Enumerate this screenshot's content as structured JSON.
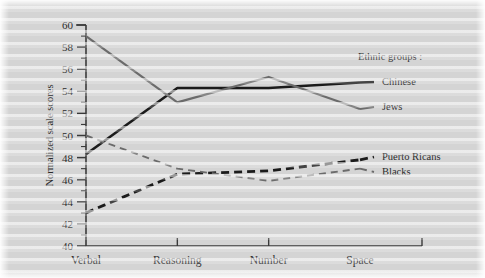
{
  "chart_data": {
    "type": "line",
    "title": "",
    "xlabel": "",
    "ylabel": "Normalized scale scores",
    "categories": [
      "Verbal",
      "Reasoning",
      "Number",
      "Space"
    ],
    "ylim": [
      40,
      60
    ],
    "ytick_step": 2,
    "yticks": [
      40,
      42,
      44,
      46,
      48,
      50,
      52,
      54,
      56,
      58,
      60
    ],
    "ytick_labels": [
      "40",
      "42",
      "44",
      "46",
      "48",
      "50",
      "52",
      "54",
      "56",
      "58",
      "60"
    ],
    "minor_tick_step": 1,
    "grid": false,
    "legend_position": "right",
    "legend_title": "Ethnic groups :",
    "series": [
      {
        "name": "Chinese",
        "values": [
          48.3,
          54.3,
          54.3,
          54.8
        ],
        "color": "#1b1b1b",
        "style": "solid",
        "width": 2.6
      },
      {
        "name": "Jews",
        "values": [
          59.0,
          53.0,
          55.3,
          52.4
        ],
        "color": "#6b6b6b",
        "style": "solid",
        "width": 2.2
      },
      {
        "name": "Puerto Ricans",
        "values": [
          43.0,
          46.5,
          46.8,
          47.8
        ],
        "color": "#1b1b1b",
        "style": "dashed",
        "width": 2.8
      },
      {
        "name": "Blacks",
        "values": [
          50.0,
          47.0,
          45.9,
          47.0
        ],
        "color": "#6b6b6b",
        "style": "dashed",
        "width": 1.9
      }
    ]
  },
  "legend": {
    "title": "Ethnic groups :",
    "entries": [
      {
        "label": "Chinese"
      },
      {
        "label": "Jews"
      },
      {
        "label": "Puerto Ricans"
      },
      {
        "label": "Blacks"
      }
    ]
  },
  "axis": {
    "y_title": "Normalized scale scores",
    "y_labels": [
      "60",
      "58",
      "56",
      "54",
      "52",
      "50",
      "48",
      "46",
      "44",
      "42",
      "40"
    ],
    "x_labels": [
      "Verbal",
      "Reasoning",
      "Number",
      "Space"
    ]
  },
  "colors": {
    "background": "#d4d4d4",
    "ink_dark": "#1b1b1b",
    "ink_gray": "#6b6b6b",
    "axis": "#3a3a3a"
  }
}
